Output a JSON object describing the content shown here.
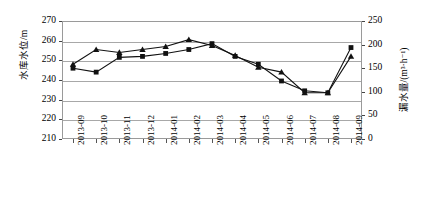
{
  "chart_data": {
    "type": "line",
    "title": "",
    "subtitle": "",
    "xlabel": "",
    "ylabel": "水库水位/m",
    "ylabel_right": "漏水量/(m3·h-1)",
    "ylabel_right_display": "漏水量/(m³·h⁻¹)",
    "grid": true,
    "legend": "none",
    "ylim": [
      210,
      270
    ],
    "ylim_right": [
      0,
      250
    ],
    "yticks": [
      210,
      220,
      230,
      240,
      250,
      260,
      270
    ],
    "yticks_right": [
      0,
      50,
      100,
      150,
      200,
      250
    ],
    "categories": [
      "2013-09",
      "2013-10",
      "2013-11",
      "2013-12",
      "2014-01",
      "2014-02",
      "2014-03",
      "2014-04",
      "2014-05",
      "2014-06",
      "2014-07",
      "2014-08",
      "2014-09"
    ],
    "series": [
      {
        "name": "水库水位",
        "marker": "square",
        "axis": "left",
        "values": [
          246.0,
          244.0,
          251.5,
          252.0,
          253.5,
          255.5,
          258.5,
          252.0,
          248.0,
          239.5,
          234.5,
          233.5,
          256.5
        ]
      },
      {
        "name": "漏水量",
        "marker": "triangle",
        "axis": "left",
        "values": [
          248.0,
          255.5,
          254.0,
          255.5,
          257.0,
          260.5,
          257.5,
          252.5,
          246.5,
          244.0,
          233.5,
          233.5,
          252.0
        ]
      }
    ],
    "colors": {
      "line": "#111111",
      "grid": "#a8a8a8",
      "frame": "#9a9a9a",
      "background": "#ffffff"
    }
  }
}
